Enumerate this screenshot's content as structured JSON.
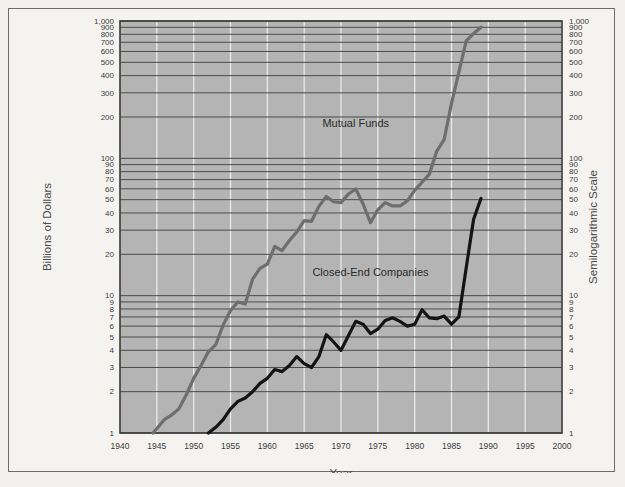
{
  "chart_data": {
    "type": "line",
    "title": "",
    "xlabel": "Year",
    "ylabel": "Billions of Dollars",
    "ylabel_right": "Semilogarithmic Scale",
    "yscale": "log",
    "ylim": [
      1,
      1000
    ],
    "xlim": [
      1940,
      2000
    ],
    "grid": true,
    "legend_position": "inline-annotation",
    "plot_background": "#b4b4b4",
    "gridline_color_horizontal": "#4a4a4a",
    "gridline_color_vertical": "#efefef",
    "xticks": [
      1940,
      1945,
      1950,
      1955,
      1960,
      1965,
      1970,
      1975,
      1980,
      1985,
      1990,
      1995,
      2000
    ],
    "xticklabels": [
      "1940",
      "1945",
      "1950",
      "1955",
      "1960",
      "1965",
      "1970",
      "1975",
      "1980",
      "1985",
      "1990",
      "1995",
      "2000"
    ],
    "yticks": [
      1,
      2,
      3,
      4,
      5,
      6,
      7,
      8,
      9,
      10,
      20,
      30,
      40,
      50,
      60,
      70,
      80,
      90,
      100,
      200,
      300,
      400,
      500,
      600,
      700,
      800,
      900,
      1000
    ],
    "yticklabels": [
      "1",
      "2",
      "3",
      "4",
      "5",
      "6",
      "7",
      "8",
      "9",
      "10",
      "20",
      "30",
      "40",
      "50",
      "60",
      "70",
      "80",
      "90",
      "100",
      "200",
      "300",
      "400",
      "500",
      "600",
      "700",
      "800",
      "900",
      "1,000"
    ],
    "series": [
      {
        "name": "Mutual Funds",
        "color": "#6e6e6e",
        "label_x": 1972,
        "label_y": 170,
        "x": [
          1944.5,
          1946,
          1947,
          1948,
          1949,
          1950,
          1951,
          1952,
          1953,
          1954,
          1955,
          1956,
          1957,
          1958,
          1959,
          1960,
          1961,
          1962,
          1963,
          1964,
          1965,
          1966,
          1967,
          1968,
          1969,
          1970,
          1971,
          1972,
          1973,
          1974,
          1975,
          1976,
          1977,
          1978,
          1979,
          1980,
          1981,
          1982,
          1983,
          1984,
          1985,
          1986,
          1987,
          1988,
          1989
        ],
        "y": [
          1.0,
          1.25,
          1.35,
          1.5,
          1.9,
          2.5,
          3.1,
          3.9,
          4.4,
          6.1,
          7.8,
          9.0,
          8.7,
          13.2,
          15.8,
          17.0,
          22.8,
          21.3,
          25.2,
          29.1,
          35.2,
          34.8,
          44.7,
          52.7,
          48.3,
          47.6,
          55.0,
          59.8,
          46.5,
          34.0,
          42.2,
          47.6,
          45.0,
          45.0,
          49.0,
          58.4,
          67.0,
          76.8,
          113.0,
          137.0,
          251.0,
          424.0,
          716.0,
          810.0,
          900.0
        ]
      },
      {
        "name": "Closed-End Companies",
        "color": "#141414",
        "label_x": 1974,
        "label_y": 14,
        "x": [
          1952,
          1953,
          1954,
          1955,
          1956,
          1957,
          1958,
          1959,
          1960,
          1961,
          1962,
          1963,
          1964,
          1965,
          1966,
          1967,
          1968,
          1969,
          1970,
          1971,
          1972,
          1973,
          1974,
          1975,
          1976,
          1977,
          1978,
          1979,
          1980,
          1981,
          1982,
          1983,
          1984,
          1985,
          1986,
          1987,
          1988,
          1989
        ],
        "y": [
          1.0,
          1.1,
          1.25,
          1.5,
          1.7,
          1.8,
          2.0,
          2.3,
          2.5,
          2.9,
          2.8,
          3.1,
          3.6,
          3.2,
          3.0,
          3.6,
          5.2,
          4.6,
          4.0,
          5.1,
          6.5,
          6.2,
          5.3,
          5.7,
          6.6,
          6.9,
          6.5,
          6.0,
          6.2,
          7.9,
          6.9,
          6.8,
          7.1,
          6.2,
          7.0,
          16.0,
          36.0,
          51.0
        ]
      }
    ]
  },
  "axes": {
    "left_title": "Billions of Dollars",
    "right_title": "Semilogarithmic Scale",
    "bottom_title": "Year"
  },
  "annotations": [
    {
      "text": "Mutual Funds"
    },
    {
      "text": "Closed-End Companies"
    }
  ]
}
